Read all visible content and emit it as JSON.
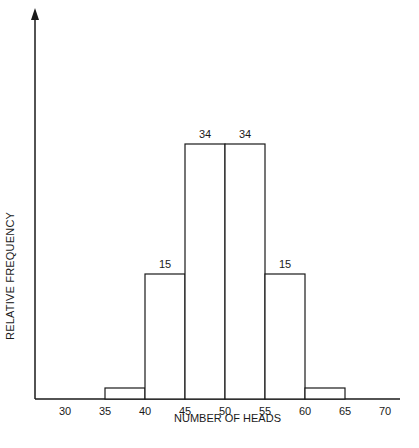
{
  "chart_data": {
    "type": "bar",
    "title": "",
    "xlabel": "NUMBER OF HEADS",
    "ylabel": "RELATIVE FREQUENCY",
    "bin_edges": [
      35,
      40,
      45,
      50,
      55,
      60,
      65
    ],
    "categories": [
      "35-40",
      "40-45",
      "45-50",
      "50-55",
      "55-60",
      "60-65"
    ],
    "values": [
      1,
      15,
      34,
      34,
      15,
      1
    ],
    "data_labels": [
      "",
      "15",
      "34",
      "34",
      "15",
      ""
    ],
    "x_ticks": [
      30,
      35,
      40,
      45,
      50,
      55,
      60,
      65,
      70
    ],
    "xlim": [
      25,
      74
    ],
    "ylim": [
      0,
      46
    ],
    "grid": false,
    "legend": null,
    "y_ticks_shown": false
  },
  "colors": {
    "stroke": "#1a1a1a",
    "fill": "#ffffff"
  }
}
